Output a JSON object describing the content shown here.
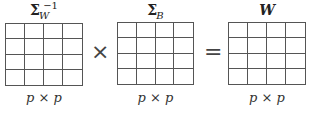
{
  "matrices": [
    {
      "id": "sigma_w_inv",
      "symbol": "Σ",
      "subscript": "W",
      "superscript": "−1",
      "rows": 4,
      "cols": 4,
      "dimension": "p × p"
    },
    {
      "id": "sigma_b",
      "symbol": "Σ",
      "subscript": "B",
      "superscript": "",
      "rows": 4,
      "cols": 4,
      "dimension": "p × p"
    },
    {
      "id": "w",
      "symbol": "W",
      "subscript": "",
      "superscript": "",
      "rows": 4,
      "cols": 4,
      "dimension": "p × p"
    }
  ],
  "operators": {
    "multiply": "×",
    "equals": "="
  },
  "colors": {
    "grid_line": "#555555",
    "text": "#222222",
    "background": "#ffffff"
  }
}
